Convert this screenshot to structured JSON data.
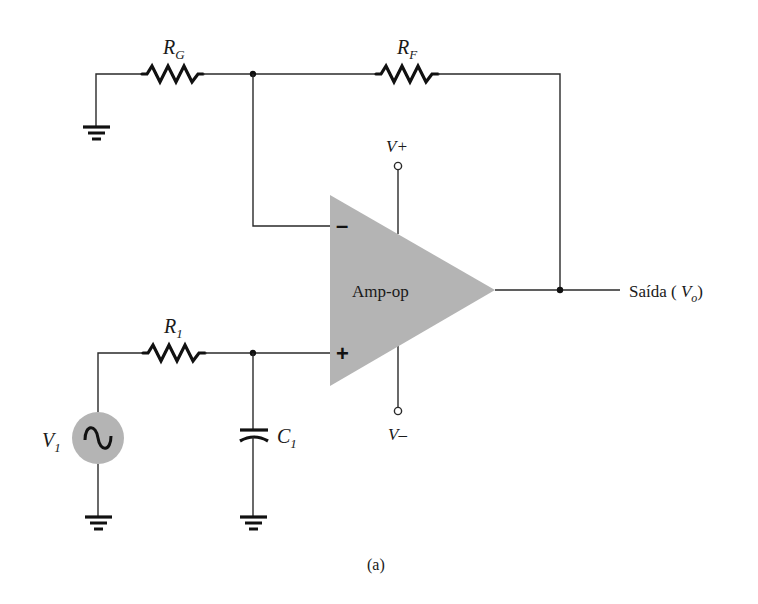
{
  "diagram": {
    "caption": "(a)",
    "colors": {
      "wire": "#2a2a2a",
      "component": "#111111",
      "opamp_fill": "#b4b4b4",
      "source_fill": "#b4b4b4"
    },
    "components": {
      "rg": {
        "symbol": "R",
        "subscript": "G",
        "type": "resistor"
      },
      "rf": {
        "symbol": "R",
        "subscript": "F",
        "type": "resistor"
      },
      "r1": {
        "symbol": "R",
        "subscript": "1",
        "type": "resistor"
      },
      "c1": {
        "symbol": "C",
        "subscript": "1",
        "type": "capacitor"
      },
      "v1": {
        "symbol": "V",
        "subscript": "1",
        "type": "ac-source"
      },
      "opamp": {
        "label": "Amp-op",
        "inverting_sign": "–",
        "noninverting_sign": "+"
      },
      "vplus": {
        "label": "V+"
      },
      "vminus": {
        "label": "V–"
      },
      "output": {
        "prefix": "Saída ( ",
        "symbol": "V",
        "subscript": "o",
        "suffix": ")"
      }
    }
  }
}
